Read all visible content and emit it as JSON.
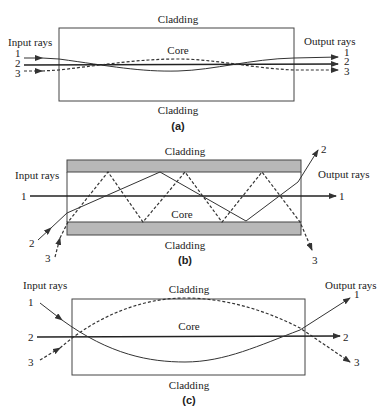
{
  "panel_a": {
    "cladding_top": "Cladding",
    "cladding_bottom": "Cladding",
    "core": "Core",
    "input_label": "Input rays",
    "output_label": "Output rays",
    "ray_labels_in": [
      "1",
      "2",
      "3"
    ],
    "ray_labels_out": [
      "1",
      "2",
      "3"
    ],
    "caption": "(a)"
  },
  "panel_b": {
    "cladding_top": "Cladding",
    "cladding_bottom": "Cladding",
    "core": "Core",
    "input_label": "Input rays",
    "output_label": "Output rays",
    "ray_labels_in": [
      "1",
      "2",
      "3"
    ],
    "ray_labels_out": [
      "1",
      "2",
      "3"
    ],
    "caption": "(b)"
  },
  "panel_c": {
    "cladding_top": "Cladding",
    "cladding_bottom": "Cladding",
    "core": "Core",
    "input_label": "Input rays",
    "output_label": "Output rays",
    "ray_labels_in": [
      "1",
      "2",
      "3"
    ],
    "ray_labels_out": [
      "1",
      "2",
      "3"
    ],
    "caption": "(c)"
  },
  "colors": {
    "line": "#333333",
    "cladding_fill": "#b8b8b8"
  }
}
